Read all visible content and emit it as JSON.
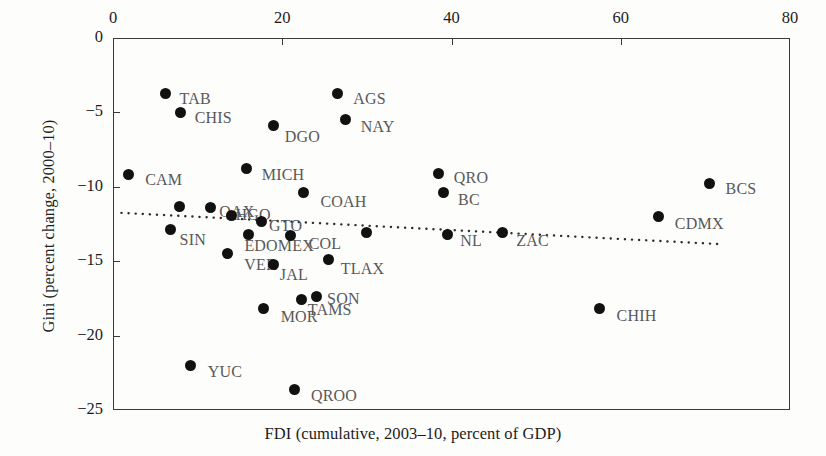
{
  "chart_data": {
    "type": "scatter",
    "title": "",
    "xlabel": "FDI (cumulative, 2003–10, percent of GDP)",
    "ylabel": "Gini (percent change, 2000–10)",
    "xlim": [
      0,
      80
    ],
    "ylim": [
      -25,
      0
    ],
    "x_axis_position": "top",
    "xticks": [
      0,
      20,
      40,
      60,
      80
    ],
    "xtick_labels": [
      "0",
      "20",
      "40",
      "60",
      "80"
    ],
    "yticks": [
      0,
      -5,
      -10,
      -15,
      -20,
      -25
    ],
    "ytick_labels": [
      "0",
      "−5",
      "−10",
      "−15",
      "−20",
      "−25"
    ],
    "grid": false,
    "legend": "none",
    "marker_color": "#111111",
    "label_color": "#58585a",
    "trendline": {
      "style": "dotted",
      "x_start": 1.0,
      "y_start": -11.75,
      "x_end": 71.5,
      "y_end": -13.85
    },
    "points": [
      {
        "label": "TAB",
        "x": 6.2,
        "y": -3.7,
        "label_dx": 14,
        "label_dy": 7
      },
      {
        "label": "CHIS",
        "x": 8.0,
        "y": -5.0,
        "label_dx": 14,
        "label_dy": 7
      },
      {
        "label": "AGS",
        "x": 26.5,
        "y": -3.75,
        "label_dx": 16,
        "label_dy": 6
      },
      {
        "label": "NAY",
        "x": 27.5,
        "y": -5.5,
        "label_dx": 15,
        "label_dy": 8
      },
      {
        "label": "DGO",
        "x": 19.0,
        "y": -5.9,
        "label_dx": 11,
        "label_dy": 12
      },
      {
        "label": "CAM",
        "x": 1.8,
        "y": -9.2,
        "label_dx": 17,
        "label_dy": 6
      },
      {
        "label": "MICH",
        "x": 15.8,
        "y": -8.8,
        "label_dx": 15,
        "label_dy": 7
      },
      {
        "label": "QRO",
        "x": 38.5,
        "y": -9.1,
        "label_dx": 15,
        "label_dy": 6
      },
      {
        "label": "BCS",
        "x": 70.5,
        "y": -9.8,
        "label_dx": 16,
        "label_dy": 6
      },
      {
        "label": "COAH",
        "x": 22.5,
        "y": -10.4,
        "label_dx": 17,
        "label_dy": 10
      },
      {
        "label": "BC",
        "x": 39.0,
        "y": -10.4,
        "label_dx": 15,
        "label_dy": 8
      },
      {
        "label": "OAX",
        "x": 11.5,
        "y": -11.4,
        "label_dx": 9,
        "label_dy": 5
      },
      {
        "label": "",
        "x": 7.9,
        "y": -11.3,
        "label_dx": 0,
        "label_dy": 0
      },
      {
        "label": "HGO",
        "x": 14.0,
        "y": -11.9,
        "label_dx": 4,
        "label_dy": 1
      },
      {
        "label": "GTO",
        "x": 17.5,
        "y": -12.3,
        "label_dx": 8,
        "label_dy": 6
      },
      {
        "label": "CDMX",
        "x": 64.5,
        "y": -12.0,
        "label_dx": 16,
        "label_dy": 8
      },
      {
        "label": "SIN",
        "x": 6.8,
        "y": -12.9,
        "label_dx": 9,
        "label_dy": 11
      },
      {
        "label": "EDOMEX",
        "x": 16.0,
        "y": -13.2,
        "label_dx": -4,
        "label_dy": 13
      },
      {
        "label": "COL",
        "x": 21.0,
        "y": -13.3,
        "label_dx": 18,
        "label_dy": 9
      },
      {
        "label": "",
        "x": 30.0,
        "y": -13.1,
        "label_dx": 0,
        "label_dy": 0
      },
      {
        "label": "NL",
        "x": 39.5,
        "y": -13.2,
        "label_dx": 13,
        "label_dy": 8
      },
      {
        "label": "ZAC",
        "x": 46.0,
        "y": -13.1,
        "label_dx": 14,
        "label_dy": 9
      },
      {
        "label": "VER",
        "x": 13.5,
        "y": -14.5,
        "label_dx": 17,
        "label_dy": 12
      },
      {
        "label": "JAL",
        "x": 19.0,
        "y": -15.2,
        "label_dx": 6,
        "label_dy": 12
      },
      {
        "label": "TLAX",
        "x": 25.5,
        "y": -14.9,
        "label_dx": 12,
        "label_dy": 10
      },
      {
        "label": "MOR",
        "x": 17.8,
        "y": -18.2,
        "label_dx": 17,
        "label_dy": 9
      },
      {
        "label": "TAMS",
        "x": 22.3,
        "y": -17.6,
        "label_dx": 6,
        "label_dy": 11
      },
      {
        "label": "SON",
        "x": 24.0,
        "y": -17.4,
        "label_dx": 11,
        "label_dy": 3
      },
      {
        "label": "CHIH",
        "x": 57.5,
        "y": -18.2,
        "label_dx": 17,
        "label_dy": 8
      },
      {
        "label": "YUC",
        "x": 9.2,
        "y": -22.0,
        "label_dx": 17,
        "label_dy": 8
      },
      {
        "label": "QROO",
        "x": 21.5,
        "y": -23.6,
        "label_dx": 16,
        "label_dy": 8
      }
    ]
  }
}
